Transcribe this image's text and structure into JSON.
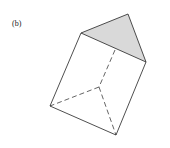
{
  "figure": {
    "label": "(b)",
    "shade_color": "#d9d9d9",
    "line_color": "#222222"
  }
}
